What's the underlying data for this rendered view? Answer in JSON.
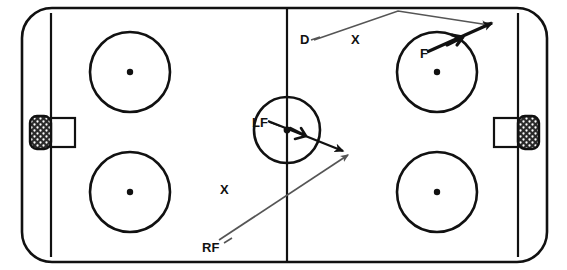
{
  "diagram": {
    "surface_color": "#ffffff",
    "line_color": "#111111",
    "arrow_color": "#555555",
    "bold_arrow_color": "#111111",
    "net_fill_color": "#333333"
  },
  "rink": {
    "boundary": {
      "x": 22,
      "y": 8,
      "width": 525,
      "height": 254,
      "corner_radius": 30
    },
    "center_line": {
      "x": 287,
      "y1": 8,
      "y2": 262
    },
    "goal_lines": [
      {
        "name": "left-goal-line",
        "x": 51,
        "y1": 13,
        "y2": 257
      },
      {
        "name": "right-goal-line",
        "x": 518,
        "y1": 13,
        "y2": 257
      }
    ],
    "center_circle": {
      "cx": 287,
      "cy": 130,
      "r": 33
    },
    "center_dot": {
      "cx": 287,
      "cy": 130,
      "r": 3
    },
    "faceoff_circles": [
      {
        "name": "faceoff-circle-top-left",
        "cx": 130,
        "cy": 72,
        "r": 40
      },
      {
        "name": "faceoff-circle-top-right",
        "cx": 437,
        "cy": 72,
        "r": 40
      },
      {
        "name": "faceoff-circle-bottom-left",
        "cx": 130,
        "cy": 192,
        "r": 40
      },
      {
        "name": "faceoff-circle-bottom-right",
        "cx": 437,
        "cy": 192,
        "r": 40
      }
    ],
    "faceoff_dots": [
      {
        "cx": 130,
        "cy": 72,
        "r": 3
      },
      {
        "cx": 437,
        "cy": 72,
        "r": 3
      },
      {
        "cx": 130,
        "cy": 192,
        "r": 3
      },
      {
        "cx": 437,
        "cy": 192,
        "r": 3
      }
    ],
    "goals": [
      {
        "name": "goal-left",
        "net": {
          "x": 30,
          "y": 116,
          "width": 21,
          "height": 33,
          "rx": 7
        },
        "crease": {
          "x": 51,
          "y": 118,
          "width": 24,
          "height": 29
        }
      },
      {
        "name": "goal-right",
        "net": {
          "x": 518,
          "y": 116,
          "width": 21,
          "height": 33,
          "rx": 7
        },
        "crease": {
          "x": 494,
          "y": 118,
          "width": 24,
          "height": 29
        }
      }
    ]
  },
  "players": [
    {
      "id": "D",
      "label": "D",
      "x": 300,
      "y": 44
    },
    {
      "id": "X1",
      "label": "X",
      "x": 351,
      "y": 44
    },
    {
      "id": "F",
      "label": "F",
      "x": 420,
      "y": 58
    },
    {
      "id": "LF",
      "label": "LF",
      "x": 252,
      "y": 127
    },
    {
      "id": "X2",
      "label": "X",
      "x": 220,
      "y": 194
    },
    {
      "id": "RF",
      "label": "RF",
      "x": 202,
      "y": 252
    }
  ],
  "movement_arrows": [
    {
      "name": "d-pass-arrow",
      "from_label": "D",
      "style": "thin",
      "points": [
        [
          314,
          40
        ],
        [
          398,
          11
        ],
        [
          490,
          25
        ]
      ],
      "arrowhead_at": [
        490,
        25
      ]
    },
    {
      "name": "f-skate-arrow",
      "from_label": "F",
      "style": "bold",
      "points": [
        [
          427,
          52
        ],
        [
          494,
          22
        ]
      ],
      "arrowhead_at": [
        494,
        22
      ],
      "mid_arrowhead_at": [
        460,
        37
      ]
    },
    {
      "name": "lf-skate-arrow",
      "from_label": "LF",
      "style": "bold",
      "points": [
        [
          269,
          122
        ],
        [
          345,
          152
        ]
      ],
      "arrowhead_at": [
        345,
        152
      ],
      "mid_arrowhead_at": [
        303,
        136
      ]
    },
    {
      "name": "rf-skate-arrow",
      "from_label": "RF",
      "style": "thin",
      "points": [
        [
          219,
          240
        ],
        [
          350,
          153
        ]
      ],
      "arrowhead_at": [
        350,
        153
      ]
    }
  ]
}
